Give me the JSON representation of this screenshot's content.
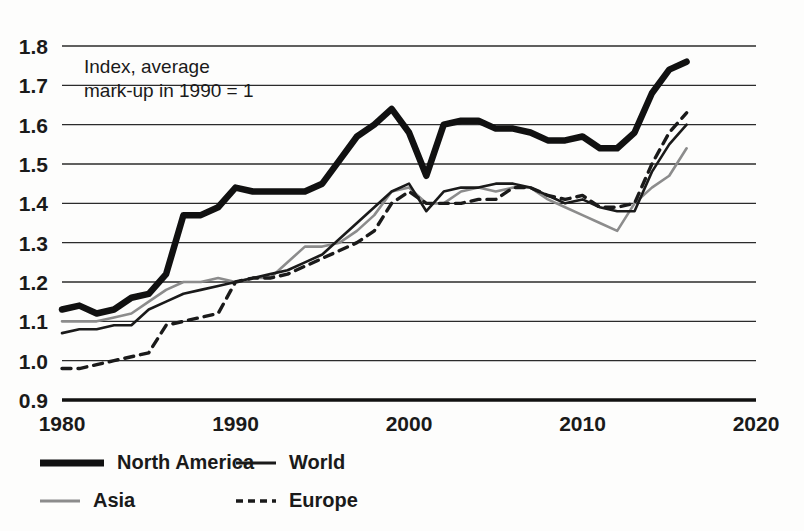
{
  "chart_data": {
    "type": "line",
    "title": "",
    "subtitle": "",
    "annotation": "Index, average\nmark-up in 1990 = 1",
    "annotation_line1": "Index, average",
    "annotation_line2": "mark-up in 1990 = 1",
    "xlabel": "",
    "ylabel": "",
    "xlim": [
      1980,
      2020
    ],
    "ylim": [
      0.9,
      1.8
    ],
    "xticks": [
      1980,
      1990,
      2000,
      2010,
      2020
    ],
    "yticks": [
      "0.9",
      "1.0",
      "1.1",
      "1.2",
      "1.3",
      "1.4",
      "1.5",
      "1.6",
      "1.7",
      "1.8"
    ],
    "grid": "horizontal",
    "legend_position": "bottom-left",
    "x": [
      1980,
      1981,
      1982,
      1983,
      1984,
      1985,
      1986,
      1987,
      1988,
      1989,
      1990,
      1991,
      1992,
      1993,
      1994,
      1995,
      1996,
      1997,
      1998,
      1999,
      2000,
      2001,
      2002,
      2003,
      2004,
      2005,
      2006,
      2007,
      2008,
      2009,
      2010,
      2011,
      2012,
      2013,
      2014,
      2015,
      2016
    ],
    "series": [
      {
        "name": "North America",
        "color": "#111111",
        "width": 6.5,
        "dash": "none",
        "values": [
          1.13,
          1.14,
          1.12,
          1.13,
          1.16,
          1.17,
          1.22,
          1.37,
          1.37,
          1.39,
          1.44,
          1.43,
          1.43,
          1.43,
          1.43,
          1.45,
          1.51,
          1.57,
          1.6,
          1.64,
          1.58,
          1.47,
          1.6,
          1.61,
          1.61,
          1.59,
          1.59,
          1.58,
          1.56,
          1.56,
          1.57,
          1.54,
          1.54,
          1.58,
          1.68,
          1.74,
          1.76
        ]
      },
      {
        "name": "World",
        "color": "#1a1a1a",
        "width": 2.6,
        "dash": "none",
        "values": [
          1.07,
          1.08,
          1.08,
          1.09,
          1.09,
          1.13,
          1.15,
          1.17,
          1.18,
          1.19,
          1.2,
          1.21,
          1.22,
          1.23,
          1.25,
          1.27,
          1.31,
          1.35,
          1.39,
          1.43,
          1.45,
          1.38,
          1.43,
          1.44,
          1.44,
          1.45,
          1.45,
          1.44,
          1.42,
          1.4,
          1.41,
          1.39,
          1.38,
          1.38,
          1.48,
          1.55,
          1.6
        ]
      },
      {
        "name": "Asia",
        "color": "#8c8c8c",
        "width": 2.6,
        "dash": "none",
        "values": [
          1.1,
          1.1,
          1.1,
          1.11,
          1.12,
          1.15,
          1.18,
          1.2,
          1.2,
          1.21,
          1.2,
          1.21,
          1.21,
          1.25,
          1.29,
          1.29,
          1.3,
          1.33,
          1.37,
          1.43,
          1.44,
          1.4,
          1.4,
          1.43,
          1.44,
          1.43,
          1.44,
          1.44,
          1.41,
          1.39,
          1.37,
          1.35,
          1.33,
          1.4,
          1.44,
          1.47,
          1.54
        ]
      },
      {
        "name": "Europe",
        "color": "#1a1a1a",
        "width": 3.4,
        "dash": "9,7",
        "values": [
          0.98,
          0.98,
          0.99,
          1.0,
          1.01,
          1.02,
          1.09,
          1.1,
          1.11,
          1.12,
          1.2,
          1.21,
          1.21,
          1.22,
          1.24,
          1.26,
          1.28,
          1.3,
          1.33,
          1.4,
          1.43,
          1.4,
          1.4,
          1.4,
          1.41,
          1.41,
          1.44,
          1.44,
          1.42,
          1.41,
          1.42,
          1.39,
          1.39,
          1.4,
          1.5,
          1.58,
          1.63
        ]
      }
    ]
  },
  "legend": {
    "items": [
      {
        "label": "North America",
        "style": "thick-solid-black"
      },
      {
        "label": "World",
        "style": "medium-solid-black"
      },
      {
        "label": "Asia",
        "style": "thin-solid-gray"
      },
      {
        "label": "Europe",
        "style": "dashed-black"
      }
    ]
  },
  "colors": {
    "background": "#fdfdfc",
    "ink": "#1a1a1a",
    "gray": "#8c8c8c",
    "grid": "#2b2b2b"
  }
}
